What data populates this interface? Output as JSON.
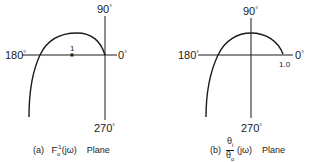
{
  "diagrams": [
    {
      "id": "a",
      "caption_prefix": "(a)",
      "caption_func": "F",
      "caption_sub": "o",
      "caption_sup": "-1",
      "caption_arg": "(jω)",
      "caption_suffix": "Plane",
      "axis_labels": {
        "top": "90",
        "bottom": "270",
        "left": "180",
        "right": "0"
      },
      "degree_symbol": "°",
      "marker_label": "1"
    },
    {
      "id": "b",
      "caption_prefix": "(b)",
      "caption_num": "θ",
      "caption_num_sub": "i",
      "caption_den": "θ",
      "caption_den_sub": "o",
      "caption_arg": "(jω)",
      "caption_suffix": "Plane",
      "axis_labels": {
        "top": "90",
        "bottom": "270",
        "left": "180",
        "right": "0"
      },
      "degree_symbol": "°",
      "intercept_label": "1.0"
    }
  ],
  "colors": {
    "ink": "#1a1a1a",
    "background": "#ffffff"
  }
}
